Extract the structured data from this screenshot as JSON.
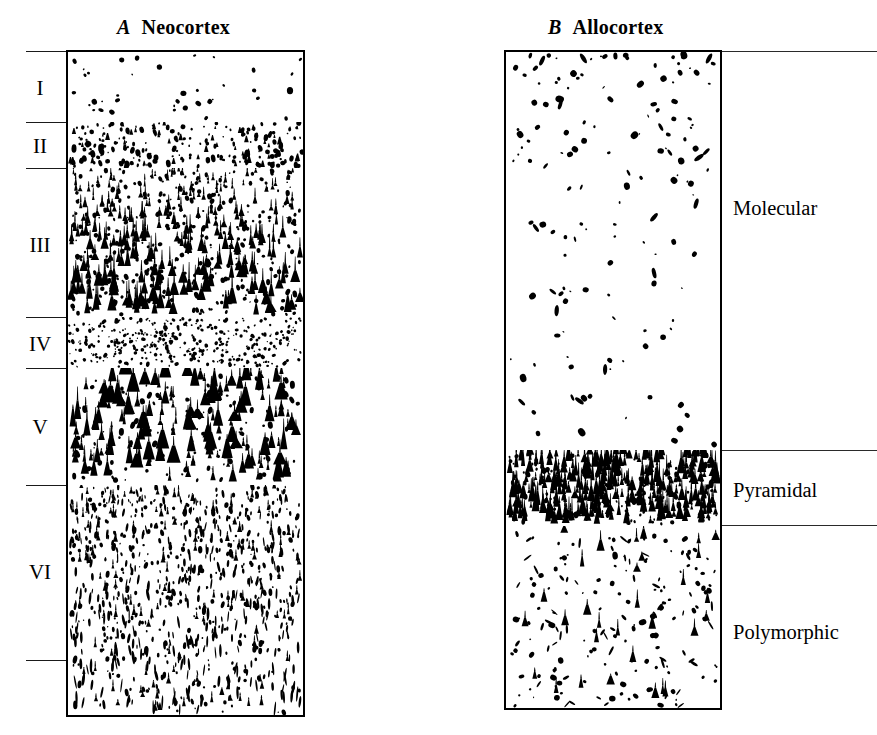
{
  "figure": {
    "width": 877,
    "height": 735,
    "background": "#ffffff",
    "ink_color": "#000000"
  },
  "panels": [
    {
      "id": "A",
      "letter": "A",
      "title": "Neocortex",
      "title_x": 117,
      "title_y": 16,
      "box": {
        "x": 66,
        "y": 50,
        "w": 239,
        "h": 667
      },
      "label_side": "left",
      "layers": [
        {
          "label": "I",
          "name": "layer-i",
          "y_top": 51,
          "y_bottom": 122,
          "density": "sparse-round",
          "description": "Molecular layer: few scattered small cells"
        },
        {
          "label": "II",
          "name": "layer-ii",
          "y_top": 122,
          "y_bottom": 168,
          "density": "dense-granular",
          "description": "External granular layer: densely packed small cells"
        },
        {
          "label": "III",
          "name": "layer-iii",
          "y_top": 168,
          "y_bottom": 317,
          "density": "pyramidal-medium",
          "description": "External pyramidal layer: pyramidal cells increasing in size with depth"
        },
        {
          "label": "IV",
          "name": "layer-iv",
          "y_top": 317,
          "y_bottom": 368,
          "density": "fine-granular",
          "description": "Internal granular layer: very fine densely packed granule cells"
        },
        {
          "label": "V",
          "name": "layer-v",
          "y_top": 368,
          "y_bottom": 485,
          "density": "pyramidal-large",
          "description": "Internal pyramidal layer: large pyramidal cells"
        },
        {
          "label": "VI",
          "name": "layer-vi",
          "y_top": 485,
          "y_bottom": 660,
          "density": "fusiform",
          "description": "Multiform layer: elongated spindle-shaped cells"
        }
      ],
      "tick_lines_y": [
        51,
        122,
        168,
        317,
        368,
        485,
        660
      ],
      "tick_line_x_start": 26,
      "tick_line_x_end": 66
    },
    {
      "id": "B",
      "letter": "B",
      "title": "Allocortex",
      "title_x": 548,
      "title_y": 16,
      "box": {
        "x": 504,
        "y": 50,
        "w": 218,
        "h": 660
      },
      "label_side": "right",
      "layers": [
        {
          "label": "Molecular",
          "name": "layer-molecular",
          "y_top": 51,
          "y_bottom": 450,
          "density": "very-sparse",
          "description": "Molecular layer: very sparse scattered cells"
        },
        {
          "label": "Pyramidal",
          "name": "layer-pyramidal",
          "y_top": 450,
          "y_bottom": 525,
          "density": "pyramidal-dense",
          "description": "Pyramidal cell layer: compact dense band of pyramidal neurons"
        },
        {
          "label": "Polymorphic",
          "name": "layer-polymorphic",
          "y_top": 525,
          "y_bottom": 710,
          "density": "sparse-mixed",
          "description": "Polymorphic layer: sparse mixed cell types"
        }
      ],
      "tick_lines_y": [
        51,
        450,
        525
      ],
      "tick_line_x_start": 722,
      "tick_line_x_end": 877,
      "label_x": 733,
      "label_positions_y": [
        205,
        487,
        631
      ]
    }
  ]
}
